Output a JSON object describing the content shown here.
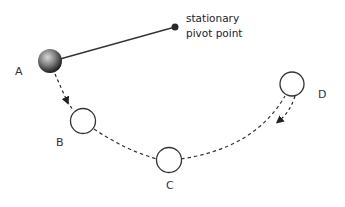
{
  "diagram": {
    "type": "pendulum-motion",
    "pivot": {
      "label_line1": "stationary",
      "label_line2": "pivot point",
      "x": 175,
      "y": 27
    },
    "positions": [
      {
        "label": "A",
        "x": 50,
        "y": 61,
        "style": "solid-ball"
      },
      {
        "label": "B",
        "x": 83,
        "y": 121,
        "style": "outline"
      },
      {
        "label": "C",
        "x": 169,
        "y": 160,
        "style": "outline"
      },
      {
        "label": "D",
        "x": 292,
        "y": 84,
        "style": "outline"
      }
    ],
    "colors": {
      "line": "#333333",
      "ball_dark": "#2a2a2a",
      "ball_light": "#bdbdbd",
      "stroke": "#333333"
    }
  }
}
